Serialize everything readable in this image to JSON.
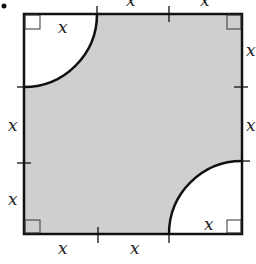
{
  "diagram": {
    "bullet": "•",
    "variable": "x",
    "colors": {
      "shade": "#cfcfcf",
      "stroke": "#111111",
      "background": "#ffffff"
    },
    "square": {
      "x": 24,
      "y": 14,
      "size": 218
    },
    "arc_radius": 73,
    "labels": {
      "top_left": "x",
      "top_right": "x",
      "top_inner": "x",
      "right_upper": "x",
      "right_lower": "x",
      "left_upper": "x",
      "left_lower": "x",
      "bottom_left": "x",
      "bottom_right": "x",
      "bottom_inner": "x"
    }
  }
}
